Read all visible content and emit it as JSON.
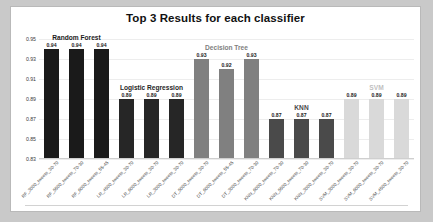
{
  "chart_data": {
    "type": "bar",
    "title": "Top 3 Results for each classifier",
    "xlabel": "",
    "ylabel": "",
    "ylim": [
      0.83,
      0.95
    ],
    "ytick_step": 0.02,
    "yticks": [
      "0.95",
      "0.93",
      "0.91",
      "0.89",
      "0.87",
      "0.85",
      "0.83"
    ],
    "grid": true,
    "legend": "none",
    "group_labels": [
      {
        "name": "Random Forest",
        "color": "#1a1a1a"
      },
      {
        "name": "Logistic Regression",
        "color": "#262626"
      },
      {
        "name": "Decision Tree",
        "color": "#808080"
      },
      {
        "name": "KNN",
        "color": "#4a4a4a"
      },
      {
        "name": "SVM",
        "color": "#bfbfbf"
      }
    ],
    "categories": [
      "RF_3000_tweets_30-70",
      "RF_5500_tweets_70-30",
      "RF_6000_tweets_55-45",
      "LR_4500_tweets_30-70",
      "LR_6000_tweets_30-70",
      "LR_3000_tweets_30-70",
      "DT_5000_tweets_30-70",
      "DT_6000_tweets_55-45",
      "DT_3000_tweets_70-30",
      "KNN_6000_tweets_70-30",
      "KNN_5500_tweets_70-30",
      "KNN_3000_tweets_30-70",
      "SVM_3000_tweets_30-70",
      "SVM_6000_tweets_30-70",
      "SVM_4500_tweets_30-70"
    ],
    "values": [
      0.94,
      0.94,
      0.94,
      0.89,
      0.89,
      0.89,
      0.93,
      0.92,
      0.93,
      0.87,
      0.87,
      0.87,
      0.89,
      0.89,
      0.89
    ],
    "value_labels": [
      "0.94",
      "0.94",
      "0.94",
      "0.89",
      "0.89",
      "0.89",
      "0.93",
      "0.92",
      "0.93",
      "0.87",
      "0.87",
      "0.87",
      "0.89",
      "0.89",
      "0.89"
    ],
    "bar_colors": [
      "#1a1a1a",
      "#1a1a1a",
      "#1a1a1a",
      "#262626",
      "#262626",
      "#262626",
      "#808080",
      "#808080",
      "#808080",
      "#4a4a4a",
      "#4a4a4a",
      "#4a4a4a",
      "#d9d9d9",
      "#d9d9d9",
      "#d9d9d9"
    ]
  }
}
